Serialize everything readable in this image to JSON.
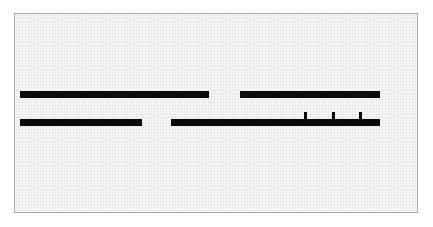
{
  "figure": {
    "type": "bar-rule-diagram",
    "width": 433,
    "height": 227,
    "page_background": "#ffffff",
    "frame": {
      "x": 14,
      "y": 13,
      "width": 404,
      "height": 200,
      "border_color": "#a9a9a9",
      "border_width": 1,
      "fill_color": "#f4f4f4",
      "texture": "speckled-dither"
    },
    "mark_color": "#0a0a0a"
  },
  "chart_data": {
    "type": "bar",
    "title": "",
    "subtitle": "",
    "xlabel": "",
    "ylabel": "",
    "grid": false,
    "legend": false,
    "orientation": "horizontal",
    "coordinate_space": "image-pixels",
    "xlim": [
      14,
      418
    ],
    "ylim": [
      13,
      213
    ],
    "categories": [
      "upper-rule",
      "lower-rule"
    ],
    "series": [
      {
        "name": "upper-rule",
        "y": 91,
        "thickness": 7,
        "segments": [
          {
            "x_start": 20,
            "x_end": 209,
            "length": 189
          },
          {
            "x_start": 240,
            "x_end": 380,
            "length": 140
          }
        ],
        "gaps": [
          {
            "x_start": 209,
            "x_end": 240,
            "length": 31
          }
        ],
        "ticks": []
      },
      {
        "name": "lower-rule",
        "y": 119,
        "thickness": 7,
        "segments": [
          {
            "x_start": 20,
            "x_end": 142,
            "length": 122
          },
          {
            "x_start": 171,
            "x_end": 380,
            "length": 209
          }
        ],
        "gaps": [
          {
            "x_start": 142,
            "x_end": 171,
            "length": 29
          }
        ],
        "ticks": [
          {
            "x": 304,
            "width": 3,
            "height": 7,
            "direction": "up"
          },
          {
            "x": 332,
            "width": 3,
            "height": 7,
            "direction": "up"
          },
          {
            "x": 359,
            "width": 3,
            "height": 7,
            "direction": "up"
          }
        ]
      }
    ]
  }
}
